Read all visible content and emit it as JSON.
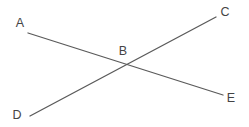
{
  "diagram": {
    "type": "intersecting-lines",
    "width": 249,
    "height": 127,
    "line_color": "#5a5a5a",
    "label_color": "#444444",
    "points": [
      {
        "id": "A",
        "label": "A",
        "x": 20,
        "y": 23
      },
      {
        "id": "B",
        "label": "B",
        "x": 123,
        "y": 51
      },
      {
        "id": "C",
        "label": "C",
        "x": 225,
        "y": 12
      },
      {
        "id": "D",
        "label": "D",
        "x": 17,
        "y": 115
      },
      {
        "id": "E",
        "label": "E",
        "x": 231,
        "y": 98
      }
    ],
    "lines": [
      {
        "id": "AE",
        "from": "A",
        "to": "E",
        "x1": 28,
        "y1": 33,
        "x2": 223,
        "y2": 95
      },
      {
        "id": "DC",
        "from": "D",
        "to": "C",
        "x1": 30,
        "y1": 116,
        "x2": 216,
        "y2": 17
      }
    ],
    "intersection": {
      "point": "B",
      "x": 125,
      "y": 64
    }
  }
}
